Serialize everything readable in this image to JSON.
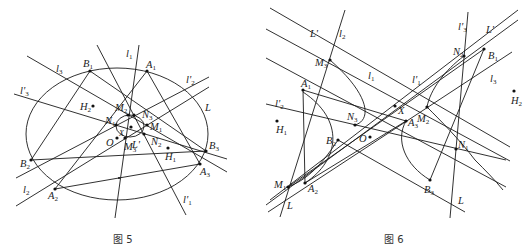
{
  "figures": [
    {
      "caption": "图 5",
      "points": [
        {
          "name": "B1",
          "label": "B",
          "sub": "1"
        },
        {
          "name": "A1",
          "label": "A",
          "sub": "1"
        },
        {
          "name": "B2",
          "label": "B",
          "sub": "2"
        },
        {
          "name": "A2",
          "label": "A",
          "sub": "2"
        },
        {
          "name": "B3",
          "label": "B",
          "sub": "3"
        },
        {
          "name": "A3",
          "label": "A",
          "sub": "3"
        },
        {
          "name": "H1",
          "label": "H",
          "sub": "1"
        },
        {
          "name": "H2",
          "label": "H",
          "sub": "2"
        },
        {
          "name": "O",
          "label": "O",
          "sub": ""
        },
        {
          "name": "X",
          "label": "X",
          "sub": ""
        },
        {
          "name": "M1",
          "label": "M",
          "sub": "1"
        },
        {
          "name": "M2",
          "label": "M",
          "sub": "2"
        },
        {
          "name": "M3",
          "label": "M",
          "sub": "3"
        },
        {
          "name": "N1",
          "label": "N",
          "sub": "1"
        },
        {
          "name": "N2",
          "label": "N",
          "sub": "2"
        },
        {
          "name": "N3",
          "label": "N",
          "sub": "3"
        }
      ],
      "lines": [
        {
          "name": "l1",
          "label": "l",
          "sub": "1"
        },
        {
          "name": "l2",
          "label": "l",
          "sub": "2"
        },
        {
          "name": "l3",
          "label": "l",
          "sub": "3"
        },
        {
          "name": "l'1",
          "label": "l'",
          "sub": "1"
        },
        {
          "name": "l'2",
          "label": "l'",
          "sub": "2"
        },
        {
          "name": "l'3",
          "label": "l'",
          "sub": "3"
        },
        {
          "name": "L",
          "label": "L",
          "sub": ""
        },
        {
          "name": "L'",
          "label": "L'",
          "sub": ""
        }
      ]
    },
    {
      "caption": "图 6",
      "points": [
        {
          "name": "A1",
          "label": "A",
          "sub": "1"
        },
        {
          "name": "A2",
          "label": "A",
          "sub": "2"
        },
        {
          "name": "A3",
          "label": "A",
          "sub": "3"
        },
        {
          "name": "B1",
          "label": "B",
          "sub": "1"
        },
        {
          "name": "B2",
          "label": "B",
          "sub": "2"
        },
        {
          "name": "B3",
          "label": "B",
          "sub": "3"
        },
        {
          "name": "M1",
          "label": "M",
          "sub": "1"
        },
        {
          "name": "M2",
          "label": "M",
          "sub": "2"
        },
        {
          "name": "M3",
          "label": "M",
          "sub": "3"
        },
        {
          "name": "N1",
          "label": "N",
          "sub": "1"
        },
        {
          "name": "N2",
          "label": "N",
          "sub": "2"
        },
        {
          "name": "N3",
          "label": "N",
          "sub": "3"
        },
        {
          "name": "H1",
          "label": "H",
          "sub": "1"
        },
        {
          "name": "H2",
          "label": "H",
          "sub": "2"
        },
        {
          "name": "O",
          "label": "O",
          "sub": ""
        },
        {
          "name": "X",
          "label": "X",
          "sub": ""
        }
      ],
      "lines": [
        {
          "name": "l1",
          "label": "l",
          "sub": "1"
        },
        {
          "name": "l2",
          "label": "l",
          "sub": "2"
        },
        {
          "name": "l3",
          "label": "l",
          "sub": "3"
        },
        {
          "name": "l'1",
          "label": "l'",
          "sub": "1"
        },
        {
          "name": "l'2",
          "label": "l'",
          "sub": "2"
        },
        {
          "name": "l'3",
          "label": "l'",
          "sub": "3"
        },
        {
          "name": "L",
          "label": "L",
          "sub": ""
        },
        {
          "name": "L'",
          "label": "L'",
          "sub": ""
        }
      ]
    }
  ]
}
